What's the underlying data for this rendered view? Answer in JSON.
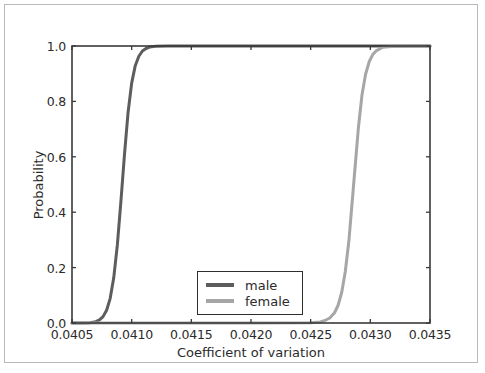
{
  "figure": {
    "background_color": "#ffffff",
    "frame_color": "#b9b9b9",
    "axis_color": "#3a3a3a"
  },
  "chart_data": {
    "type": "line",
    "title": "",
    "subtitle": "",
    "xlabel": "Coefficient of variation",
    "ylabel": "Probability",
    "xlim": [
      0.0405,
      0.0435
    ],
    "ylim": [
      0.0,
      1.0
    ],
    "xticks": [
      0.0405,
      0.041,
      0.0415,
      0.042,
      0.0425,
      0.043,
      0.0435
    ],
    "xtick_labels": [
      "0.0405",
      "0.0410",
      "0.0415",
      "0.0420",
      "0.0425",
      "0.0430",
      "0.0435"
    ],
    "yticks": [
      0.0,
      0.2,
      0.4,
      0.6,
      0.8,
      1.0
    ],
    "ytick_labels": [
      "0.0",
      "0.2",
      "0.4",
      "0.6",
      "0.8",
      "1.0"
    ],
    "grid": false,
    "legend_position": "lower center",
    "series": [
      {
        "name": "male",
        "color": "#5d5d5d",
        "linewidth": 3.0,
        "description": "cumulative distribution (CDF) rising from 0 to 1",
        "center": 0.040965,
        "scale": 4.95e-05,
        "x": [
          0.0405,
          0.0406,
          0.04065,
          0.0407,
          0.04073,
          0.04076,
          0.04079,
          0.04082,
          0.04085,
          0.04088,
          0.04091,
          0.04094,
          0.04097,
          0.041,
          0.04103,
          0.04106,
          0.04109,
          0.04112,
          0.04115,
          0.0412,
          0.0413,
          0.0415,
          0.042,
          0.043,
          0.0435
        ],
        "y": [
          0.0,
          0.0,
          0.001,
          0.005,
          0.011,
          0.023,
          0.046,
          0.089,
          0.164,
          0.282,
          0.44,
          0.61,
          0.761,
          0.866,
          0.929,
          0.963,
          0.982,
          0.991,
          0.996,
          0.999,
          1.0,
          1.0,
          1.0,
          1.0,
          1.0
        ]
      },
      {
        "name": "female",
        "color": "#a6a6a6",
        "linewidth": 3.0,
        "description": "cumulative distribution (CDF) rising from 0 to 1",
        "center": 0.04286,
        "scale": 5.2e-05,
        "x": [
          0.0405,
          0.042,
          0.0425,
          0.04258,
          0.04262,
          0.04266,
          0.0427,
          0.04273,
          0.04276,
          0.04279,
          0.04282,
          0.04286,
          0.0429,
          0.04293,
          0.04296,
          0.04299,
          0.04302,
          0.04305,
          0.0431,
          0.0432,
          0.0435
        ],
        "y": [
          0.0,
          0.0,
          0.001,
          0.004,
          0.009,
          0.018,
          0.037,
          0.064,
          0.11,
          0.185,
          0.295,
          0.5,
          0.705,
          0.823,
          0.898,
          0.943,
          0.969,
          0.983,
          0.995,
          0.999,
          1.0
        ]
      }
    ]
  },
  "legend": {
    "entries": [
      {
        "label": "male",
        "color": "#5d5d5d"
      },
      {
        "label": "female",
        "color": "#a6a6a6"
      }
    ]
  }
}
